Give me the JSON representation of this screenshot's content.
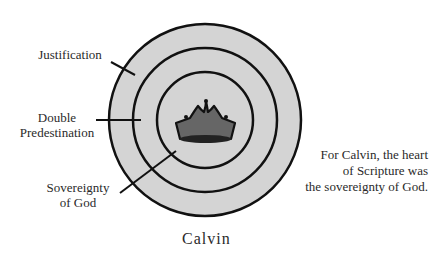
{
  "diagram": {
    "title": "Calvin",
    "rings": [
      {
        "label": "Justification",
        "level": "outer"
      },
      {
        "label": "Double Predestination",
        "level": "middle"
      },
      {
        "label": "Sovereignty of God",
        "level": "inner"
      }
    ],
    "labels": {
      "justification": "Justification",
      "double_line1": "Double",
      "double_line2": "Predestination",
      "sov_line1": "Sovereignty",
      "sov_line2": "of God"
    },
    "center_icon": "crown-icon",
    "note": {
      "line1": "For Calvin, the heart",
      "line2": "of Scripture was",
      "line3": "the sovereignty of God."
    },
    "colors": {
      "ring_fill": "#d4d4d4",
      "stroke": "#111111",
      "crown_fill": "#666666"
    }
  }
}
